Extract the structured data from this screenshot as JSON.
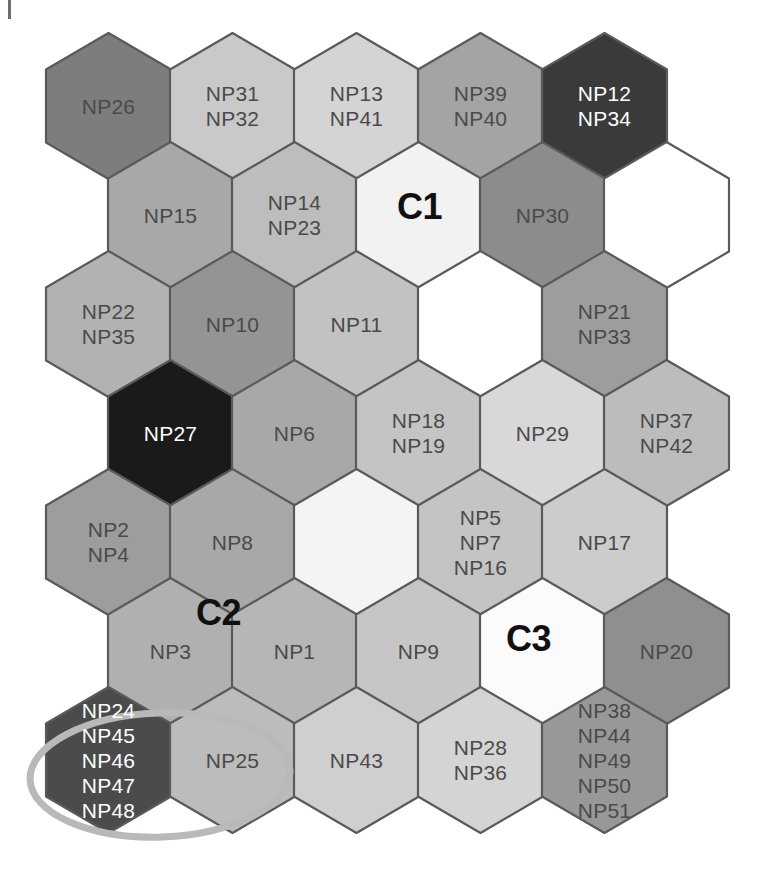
{
  "figure": {
    "type": "som-hexagonal-map",
    "title": "",
    "corner_tick": "tick-mark",
    "background_color": "#ffffff",
    "hex_geometry": {
      "hex_width": 125,
      "hex_height": 146,
      "row_pitch": 109,
      "col_pitch": 124,
      "origin_x": 46,
      "origin_y": 33,
      "odd_row_offset_x": 62,
      "rows": 7,
      "cols": 5
    },
    "stroke_color": "#5a5a5a",
    "stroke_width": 2.2
  },
  "palette": {
    "black": "#1a1a1a",
    "very_dark": "#3a3a3a",
    "dark": "#4b4b4b",
    "dark_gray": "#606060",
    "mid_dark_gray": "#7d7d7d",
    "mid_gray": "#949494",
    "gray": "#a4a4a4",
    "light_gray": "#b6b6b6",
    "lighter_gray": "#c6c6c6",
    "pale_gray": "#d2d2d2",
    "very_pale": "#dedede",
    "near_white": "#efefef",
    "white": "#ffffff"
  },
  "cells": [
    {
      "row": 0,
      "col": 0,
      "labels": [
        "NP26"
      ],
      "fill": "#7d7d7d",
      "text": "dark"
    },
    {
      "row": 0,
      "col": 1,
      "labels": [
        "NP31",
        "NP32"
      ],
      "fill": "#c9c9c9",
      "text": "dark"
    },
    {
      "row": 0,
      "col": 2,
      "labels": [
        "NP13",
        "NP41"
      ],
      "fill": "#d4d4d4",
      "text": "dark"
    },
    {
      "row": 0,
      "col": 3,
      "labels": [
        "NP39",
        "NP40"
      ],
      "fill": "#a4a4a4",
      "text": "dark"
    },
    {
      "row": 0,
      "col": 4,
      "labels": [
        "NP12",
        "NP34"
      ],
      "fill": "#3a3a3a",
      "text": "light"
    },
    {
      "row": 1,
      "col": 0,
      "labels": [
        "NP15"
      ],
      "fill": "#a8a8a8",
      "text": "dark"
    },
    {
      "row": 1,
      "col": 1,
      "labels": [
        "NP14",
        "NP23"
      ],
      "fill": "#bdbdbd",
      "text": "dark"
    },
    {
      "row": 1,
      "col": 2,
      "labels": [],
      "fill": "#f2f2f2",
      "text": "dark"
    },
    {
      "row": 1,
      "col": 3,
      "labels": [
        "NP30"
      ],
      "fill": "#8c8c8c",
      "text": "dark"
    },
    {
      "row": 1,
      "col": 4,
      "labels": [],
      "fill": "#ffffff",
      "text": "dark"
    },
    {
      "row": 2,
      "col": 0,
      "labels": [
        "NP22",
        "NP35"
      ],
      "fill": "#b2b2b2",
      "text": "dark"
    },
    {
      "row": 2,
      "col": 1,
      "labels": [
        "NP10"
      ],
      "fill": "#949494",
      "text": "dark"
    },
    {
      "row": 2,
      "col": 2,
      "labels": [
        "NP11"
      ],
      "fill": "#c2c2c2",
      "text": "dark"
    },
    {
      "row": 2,
      "col": 3,
      "labels": [],
      "fill": "#ffffff",
      "text": "dark"
    },
    {
      "row": 2,
      "col": 4,
      "labels": [
        "NP21",
        "NP33"
      ],
      "fill": "#9d9d9d",
      "text": "dark"
    },
    {
      "row": 3,
      "col": 0,
      "labels": [
        "NP27"
      ],
      "fill": "#1a1a1a",
      "text": "light"
    },
    {
      "row": 3,
      "col": 1,
      "labels": [
        "NP6"
      ],
      "fill": "#a8a8a8",
      "text": "dark"
    },
    {
      "row": 3,
      "col": 2,
      "labels": [
        "NP18",
        "NP19"
      ],
      "fill": "#c4c4c4",
      "text": "dark"
    },
    {
      "row": 3,
      "col": 3,
      "labels": [
        "NP29"
      ],
      "fill": "#d8d8d8",
      "text": "dark"
    },
    {
      "row": 3,
      "col": 4,
      "labels": [
        "NP37",
        "NP42"
      ],
      "fill": "#bcbcbc",
      "text": "dark"
    },
    {
      "row": 4,
      "col": 0,
      "labels": [
        "NP2",
        "NP4"
      ],
      "fill": "#9d9d9d",
      "text": "dark"
    },
    {
      "row": 4,
      "col": 1,
      "labels": [
        "NP8"
      ],
      "fill": "#a8a8a8",
      "text": "dark"
    },
    {
      "row": 4,
      "col": 2,
      "labels": [],
      "fill": "#f4f4f4",
      "text": "dark"
    },
    {
      "row": 4,
      "col": 3,
      "labels": [
        "NP5",
        "NP7",
        "NP16"
      ],
      "fill": "#c4c4c4",
      "text": "dark"
    },
    {
      "row": 4,
      "col": 4,
      "labels": [
        "NP17"
      ],
      "fill": "#cccccc",
      "text": "dark"
    },
    {
      "row": 5,
      "col": 0,
      "labels": [
        "NP3"
      ],
      "fill": "#b0b0b0",
      "text": "dark"
    },
    {
      "row": 5,
      "col": 1,
      "labels": [
        "NP1"
      ],
      "fill": "#b6b6b6",
      "text": "dark"
    },
    {
      "row": 5,
      "col": 2,
      "labels": [
        "NP9"
      ],
      "fill": "#c6c6c6",
      "text": "dark"
    },
    {
      "row": 5,
      "col": 3,
      "labels": [],
      "fill": "#fbfbfb",
      "text": "dark"
    },
    {
      "row": 5,
      "col": 4,
      "labels": [
        "NP20"
      ],
      "fill": "#8f8f8f",
      "text": "dark"
    },
    {
      "row": 6,
      "col": 0,
      "labels": [
        "NP24",
        "NP45",
        "NP46",
        "NP47",
        "NP48"
      ],
      "fill": "#4b4b4b",
      "text": "light"
    },
    {
      "row": 6,
      "col": 1,
      "labels": [
        "NP25"
      ],
      "fill": "#bcbcbc",
      "text": "dark"
    },
    {
      "row": 6,
      "col": 2,
      "labels": [
        "NP43"
      ],
      "fill": "#cfcfcf",
      "text": "dark"
    },
    {
      "row": 6,
      "col": 3,
      "labels": [
        "NP28",
        "NP36"
      ],
      "fill": "#d4d4d4",
      "text": "dark"
    },
    {
      "row": 6,
      "col": 4,
      "labels": [
        "NP38",
        "NP44",
        "NP49",
        "NP50",
        "NP51"
      ],
      "fill": "#989898",
      "text": "dark"
    }
  ],
  "cluster_labels": [
    {
      "name": "C1",
      "text": "C1",
      "x": 397,
      "y": 186
    },
    {
      "name": "C2",
      "text": "C2",
      "x": 196,
      "y": 592
    },
    {
      "name": "C3",
      "text": "C3",
      "x": 506,
      "y": 618
    }
  ],
  "annotations": [
    {
      "name": "highlight-ellipse",
      "shape": "ellipse",
      "cx": 160,
      "cy": 775,
      "rx": 130,
      "ry": 62,
      "rotation": -2,
      "stroke": "#b9b9b9",
      "stroke_width": 7,
      "encircles": [
        "NP24",
        "NP45",
        "NP46",
        "NP47",
        "NP48",
        "NP25"
      ]
    }
  ]
}
